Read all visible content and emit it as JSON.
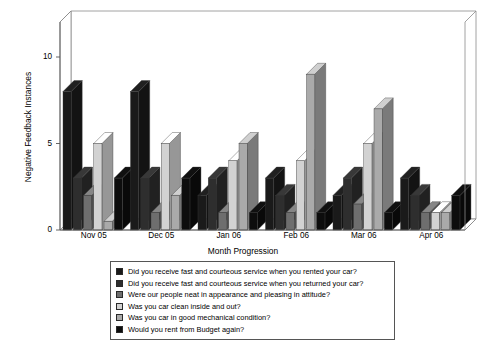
{
  "chart_data": {
    "type": "bar",
    "title": "",
    "xlabel": "Month Progression",
    "ylabel": "Negative Feedback Instances",
    "categories": [
      "Nov 05",
      "Dec 05",
      "Jan 06",
      "Feb 06",
      "Mar 06",
      "Apr 06"
    ],
    "ylim": [
      0,
      12
    ],
    "yticks": [
      0,
      5,
      10
    ],
    "ytick_labels": [
      "0",
      "5",
      "10"
    ],
    "grid": false,
    "legend_position": "bottom",
    "style": "3d-bar",
    "series": [
      {
        "name": "Did you receive fast and courteous service when you rented your car?",
        "color": "#1a1a1a",
        "values": [
          8,
          8,
          2,
          3,
          2,
          3
        ]
      },
      {
        "name": "Did you receive fast and courteous service when you returned your car?",
        "color": "#2e2e2e",
        "values": [
          3,
          3,
          3,
          2,
          3,
          2
        ]
      },
      {
        "name": "Were our people neat in appearance and pleasing in attitude?",
        "color": "#6e6e6e",
        "values": [
          2,
          1,
          1,
          1,
          1.5,
          1
        ]
      },
      {
        "name": "Was you car clean inside and out?",
        "color": "#d2d2d2",
        "values": [
          5,
          5,
          4,
          4,
          5,
          1
        ]
      },
      {
        "name": "Was you car in good mechanical condition?",
        "color": "#aaaaaa",
        "values": [
          0.5,
          2,
          5,
          9,
          7,
          1
        ]
      },
      {
        "name": "Would you rent from Budget again?",
        "color": "#0d0d0d",
        "values": [
          3,
          3,
          1,
          1,
          1,
          2
        ]
      }
    ]
  },
  "legend": {
    "items": [
      {
        "label": "Did you receive fast and courteous service when you rented your car?",
        "color": "#1a1a1a"
      },
      {
        "label": "Did you receive fast and courteous service when you returned your car?",
        "color": "#2e2e2e"
      },
      {
        "label": "Were our people neat in appearance and pleasing in attitude?",
        "color": "#6e6e6e"
      },
      {
        "label": "Was you car clean inside and out?",
        "color": "#d2d2d2"
      },
      {
        "label": "Was you car in good mechanical condition?",
        "color": "#aaaaaa"
      },
      {
        "label": "Would you rent from Budget again?",
        "color": "#0d0d0d"
      }
    ]
  }
}
